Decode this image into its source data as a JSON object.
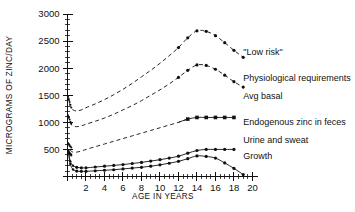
{
  "chart_data": {
    "type": "line",
    "title": "",
    "xlabel": "AGE IN YEARS",
    "ylabel": "MICROGRAMS OF ZINC/DAY",
    "xlim": [
      0,
      20.6
    ],
    "ylim": [
      0,
      3000
    ],
    "grid": false,
    "legend_position": "right-inline-labels",
    "xticks": [
      0,
      2,
      4,
      6,
      8,
      10,
      12,
      14,
      16,
      18,
      20
    ],
    "xtick_labels": [
      "",
      "2",
      "4",
      "6",
      "8",
      "10",
      "12",
      "14",
      "16",
      "18",
      "20"
    ],
    "xtick_minor_step": 0.5,
    "yticks": [
      0,
      500,
      1000,
      1500,
      2000,
      2500,
      3000
    ],
    "ytick_labels": [
      "",
      "500",
      "1000",
      "1500",
      "2000",
      "2500",
      "3000"
    ],
    "ytick_minor_step": 100,
    "series": [
      {
        "name": "\"Low risk\"",
        "label": "\"Low risk\"",
        "style": "dashed",
        "markers": "dots-upper-segment",
        "label_x": 19.0,
        "label_y": 2250,
        "x": [
          0.1,
          0.3,
          0.6,
          1.0,
          1.5,
          2.0,
          3.0,
          4.0,
          5.0,
          6.0,
          7.0,
          8.0,
          9.0,
          10.0,
          11.0,
          12.0,
          13.0,
          14.0,
          15.0,
          16.0,
          17.0,
          18.0,
          19.0
        ],
        "y": [
          1480,
          1290,
          1230,
          1210,
          1230,
          1270,
          1340,
          1420,
          1510,
          1610,
          1720,
          1840,
          1960,
          2090,
          2230,
          2380,
          2560,
          2690,
          2680,
          2600,
          2470,
          2330,
          2200
        ]
      },
      {
        "name": "Physiological requirements",
        "label": "Physiological requirements",
        "style": "dashed",
        "markers": "dots-upper-segment",
        "label_x": 19.0,
        "label_y": 1760,
        "x": [
          0.1,
          0.3,
          0.6,
          1.0,
          1.5,
          2.0,
          3.0,
          4.0,
          5.0,
          6.0,
          7.0,
          8.0,
          9.0,
          10.0,
          11.0,
          12.0,
          13.0,
          14.0,
          15.0,
          16.0,
          17.0,
          18.0,
          19.0
        ],
        "y": [
          1130,
          985,
          935,
          920,
          935,
          965,
          1020,
          1080,
          1150,
          1230,
          1310,
          1400,
          1500,
          1600,
          1710,
          1830,
          1960,
          2060,
          2050,
          1980,
          1870,
          1750,
          1650
        ]
      },
      {
        "name": "Avg basal",
        "label": "Avg basal",
        "style": "label-only",
        "label_x": 19.0,
        "label_y": 1440,
        "x": [],
        "y": []
      },
      {
        "name": "Endogenous zinc in feces",
        "label": "Endogenous zinc in feces",
        "style": "dashed-then-solid",
        "markers": "squares",
        "label_x": 19.0,
        "label_y": 945,
        "x": [
          0.1,
          0.3,
          0.6,
          1.0,
          1.5,
          2.0,
          3.0,
          4.0,
          5.0,
          6.0,
          7.0,
          8.0,
          9.0,
          10.0,
          11.0,
          12.0,
          13.0,
          14.0,
          15.0,
          16.0,
          17.0,
          18.0
        ],
        "y": [
          620,
          490,
          450,
          450,
          470,
          500,
          550,
          600,
          650,
          700,
          750,
          800,
          850,
          900,
          950,
          1000,
          1060,
          1090,
          1090,
          1090,
          1090,
          1090
        ],
        "marker_from_index": 16
      },
      {
        "name": "Urine and sweat",
        "label": "Urine and sweat",
        "style": "solid",
        "markers": "dots",
        "label_x": 19.0,
        "label_y": 620,
        "x": [
          0.1,
          0.3,
          0.6,
          1.0,
          1.5,
          2.0,
          3.0,
          4.0,
          5.0,
          6.0,
          7.0,
          8.0,
          9.0,
          10.0,
          11.0,
          12.0,
          13.0,
          14.0,
          15.0,
          16.0,
          17.0,
          18.0
        ],
        "y": [
          470,
          280,
          200,
          170,
          160,
          160,
          175,
          190,
          205,
          220,
          240,
          260,
          285,
          310,
          340,
          375,
          430,
          480,
          500,
          500,
          500,
          500
        ]
      },
      {
        "name": "Growth",
        "label": "Growth",
        "style": "solid",
        "markers": "dots",
        "label_x": 19.0,
        "label_y": 330,
        "x": [
          0.1,
          0.3,
          0.6,
          1.0,
          1.5,
          2.0,
          3.0,
          4.0,
          5.0,
          6.0,
          7.0,
          8.0,
          9.0,
          10.0,
          11.0,
          12.0,
          13.0,
          14.0,
          15.0,
          16.0,
          17.0,
          18.0,
          19.0
        ],
        "y": [
          450,
          230,
          130,
          100,
          95,
          95,
          105,
          115,
          125,
          140,
          155,
          170,
          190,
          215,
          245,
          280,
          330,
          380,
          370,
          340,
          250,
          150,
          35
        ]
      }
    ],
    "annotations": []
  },
  "axes": {
    "y_title": "MICROGRAMS OF ZINC/DAY",
    "x_title": "AGE IN YEARS",
    "y_labels": [
      "3000",
      "2500",
      "2000",
      "1500",
      "1000",
      "500"
    ],
    "x_labels": [
      "2",
      "4",
      "6",
      "8",
      "10",
      "12",
      "14",
      "16",
      "18",
      "20"
    ]
  },
  "labels": {
    "low_risk": "\"Low risk\"",
    "physiological_requirements": "Physiological requirements",
    "avg_basal": "Avg basal",
    "endogenous": "Endogenous zinc in feces",
    "urine_and_sweat": "Urine and sweat",
    "growth": "Growth"
  },
  "colors": {
    "ink": "#111111",
    "background": "#ffffff"
  }
}
